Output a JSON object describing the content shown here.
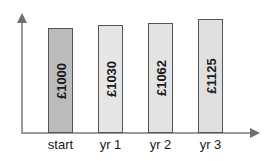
{
  "chart_data": {
    "type": "bar",
    "title": "",
    "subtitle": "",
    "xlabel": "",
    "ylabel": "",
    "grid": false,
    "legend": false,
    "categories": [
      "start",
      "yr 1",
      "yr 2",
      "yr 3"
    ],
    "values": [
      1000,
      1030,
      1062,
      1125
    ],
    "currency_symbol": "£",
    "data_labels": [
      "£1000",
      "£1030",
      "£1062",
      "£1125"
    ],
    "ylim": [
      0,
      1200
    ],
    "axis_ticks": [],
    "bars": [
      {
        "category": "start",
        "value": 1000,
        "label": "£1000",
        "fill": "#bcbcbc",
        "stroke": "#555555",
        "highlight": true
      },
      {
        "category": "yr 1",
        "value": 1030,
        "label": "£1030",
        "fill": "#e6e6e6",
        "stroke": "#555555",
        "highlight": false
      },
      {
        "category": "yr 2",
        "value": 1062,
        "label": "£1062",
        "fill": "#e3e3e3",
        "stroke": "#555555",
        "highlight": false
      },
      {
        "category": "yr 3",
        "value": 1125,
        "label": "£1125",
        "fill": "#e0e0e0",
        "stroke": "#555555",
        "highlight": false
      }
    ],
    "colors": {
      "axis": "#9a9a9a",
      "arrow": "#6f6f6f",
      "bar_highlight": "#bcbcbc",
      "bar_default": "#e6e6e6",
      "bar_border": "#555555",
      "text": "#1a1a1a",
      "background": "#ffffff"
    }
  }
}
